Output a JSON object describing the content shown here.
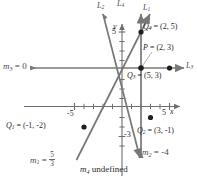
{
  "figure": {
    "axes": {
      "x_axis_label": "x",
      "y_axis_label": "y",
      "x_tick_labels": [
        "-5",
        "5"
      ],
      "y_tick_labels": [
        "5",
        "-3"
      ],
      "x_range": [
        -7,
        7
      ],
      "y_range": [
        -5,
        6
      ],
      "origin_px": [
        122,
        68
      ],
      "unit_px": 9.5
    },
    "line_labels": [
      {
        "name": "line-label-L2",
        "text": "L",
        "sub": "2",
        "x": 97,
        "y": 2
      },
      {
        "name": "line-label-L4",
        "text": "L",
        "sub": "4",
        "x": 117,
        "y": 0
      },
      {
        "name": "line-label-L1",
        "text": "L",
        "sub": "1",
        "x": 143,
        "y": 4
      },
      {
        "name": "line-label-L3",
        "text": "L",
        "sub": "3",
        "x": 186,
        "y": 62
      }
    ],
    "point_labels": [
      {
        "name": "point-label-Q4",
        "text": "Q",
        "sub": "4",
        "value": " = (2, 5)",
        "x": 143,
        "y": 27
      },
      {
        "name": "point-label-P",
        "text": "P",
        "sub": "",
        "value": " = (2, 3)",
        "x": 143,
        "y": 48
      },
      {
        "name": "point-label-Q3",
        "text": "Q",
        "sub": "3",
        "value": " = (5, 3)",
        "x": 128,
        "y": 72
      },
      {
        "name": "point-label-Q1",
        "text": "Q",
        "sub": "1",
        "value": " = (-1, -2)",
        "x": 8,
        "y": 124
      },
      {
        "name": "point-label-Q2",
        "text": "Q",
        "sub": "2",
        "value": " = (3, -1)",
        "x": 138,
        "y": 129
      }
    ],
    "slope_labels": [
      {
        "name": "slope-label-m3",
        "text": "m",
        "sub": "3",
        "value": " = 0",
        "x": 4,
        "y": 64
      },
      {
        "name": "slope-label-m1",
        "text": "m",
        "sub": "1",
        "value": " = ",
        "fraction": {
          "num": "5",
          "den": "3"
        },
        "x": 31,
        "y": 153
      },
      {
        "name": "slope-label-m4",
        "text": "m",
        "sub": "4",
        "value": " undefined",
        "x": 82,
        "y": 166
      },
      {
        "name": "slope-label-m2",
        "text": "m",
        "sub": "2",
        "value": " = -4",
        "x": 143,
        "y": 150
      }
    ],
    "points": [
      {
        "name": "point-Q4",
        "label": "Q4",
        "coords": [
          2,
          5
        ]
      },
      {
        "name": "point-P",
        "label": "P",
        "coords": [
          2,
          3
        ]
      },
      {
        "name": "point-Q3",
        "label": "Q3",
        "coords": [
          5,
          3
        ]
      },
      {
        "name": "point-Q1",
        "label": "Q1",
        "coords": [
          -1,
          -2
        ]
      },
      {
        "name": "point-Q2",
        "label": "Q2",
        "coords": [
          3,
          -1
        ]
      }
    ],
    "lines": [
      {
        "name": "line-L1",
        "slope": "5/3",
        "through": [
          2,
          3
        ]
      },
      {
        "name": "line-L2",
        "slope": "-4",
        "through": [
          2,
          3
        ]
      },
      {
        "name": "line-L3",
        "slope": "0",
        "through": [
          2,
          3
        ]
      },
      {
        "name": "line-L4",
        "slope": "undefined",
        "through": [
          2,
          3
        ]
      }
    ],
    "colors": {
      "axis": "#6e6e6e",
      "line": "#777777",
      "point": "#1f1f1f",
      "text": "#4a4a4a",
      "text_dark": "#2b2b2b",
      "leader": "#9a9a9a"
    }
  }
}
